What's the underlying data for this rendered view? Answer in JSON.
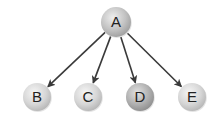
{
  "diagram": {
    "type": "tree",
    "root": "A",
    "nodes": [
      {
        "id": "A",
        "label": "A",
        "cx": 116,
        "cy": 22,
        "r": 15,
        "fill": "#c4c4c4",
        "level": 0
      },
      {
        "id": "B",
        "label": "B",
        "cx": 37,
        "cy": 97,
        "r": 14,
        "fill": "#d8d8d8",
        "level": 1
      },
      {
        "id": "C",
        "label": "C",
        "cx": 88,
        "cy": 97,
        "r": 14,
        "fill": "#d8d8d8",
        "level": 1
      },
      {
        "id": "D",
        "label": "D",
        "cx": 140,
        "cy": 97,
        "r": 14,
        "fill": "#b8b8b8",
        "level": 1
      },
      {
        "id": "E",
        "label": "E",
        "cx": 192,
        "cy": 97,
        "r": 14,
        "fill": "#d8d8d8",
        "level": 1
      }
    ],
    "edges": [
      {
        "from": "A",
        "to": "B",
        "directed": true
      },
      {
        "from": "A",
        "to": "C",
        "directed": true
      },
      {
        "from": "A",
        "to": "D",
        "directed": true
      },
      {
        "from": "A",
        "to": "E",
        "directed": true
      }
    ],
    "colors": {
      "edge": "#3a3a3a",
      "label": "#222222",
      "background": "#ffffff",
      "node_highlight": "#f4f4f4"
    }
  }
}
